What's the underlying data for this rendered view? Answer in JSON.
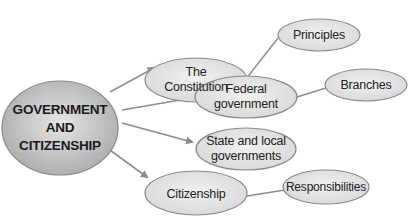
{
  "diagram": {
    "central": {
      "label_lines": [
        "GOVERNMENT",
        "AND",
        "CITIZENSHIP"
      ]
    },
    "topics": [
      {
        "id": "constitution",
        "label_lines": [
          "The",
          "Constitution"
        ]
      },
      {
        "id": "federal",
        "label_lines": [
          "Federal",
          "government"
        ]
      },
      {
        "id": "state",
        "label_lines": [
          "State and local",
          "governments"
        ]
      },
      {
        "id": "citizenship",
        "label_lines": [
          "Citizenship"
        ]
      }
    ],
    "subtopics": [
      {
        "id": "principles",
        "parent": "constitution",
        "label": "Principles"
      },
      {
        "id": "branches",
        "parent": "federal",
        "label": "Branches"
      },
      {
        "id": "responsibilities",
        "parent": "citizenship",
        "label": "Responsibilities"
      }
    ],
    "colors": {
      "node_fill": "#e3e3e3",
      "node_stroke": "#8a8a8a",
      "central_fill": "#bdbdbd",
      "connector": "#8c8c8c"
    }
  }
}
